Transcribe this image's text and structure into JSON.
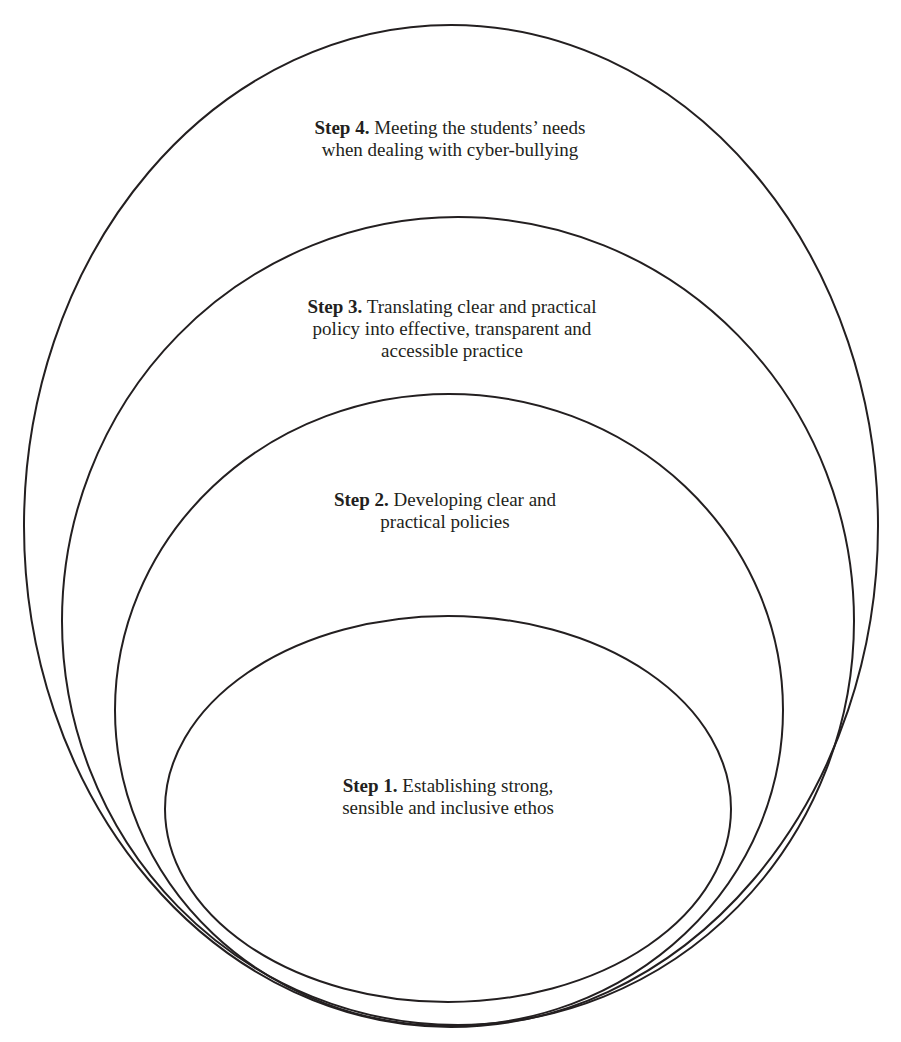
{
  "diagram": {
    "type": "nested-ellipses",
    "stroke_color": "#231f20",
    "background": "#ffffff",
    "layers": [
      {
        "id": "step4",
        "step_label": "Step 4.",
        "lines": [
          "Meeting the students’ needs",
          "when dealing with cyber-bullying"
        ],
        "line1_rest": " Meeting the students’ needs",
        "line2": "when dealing with cyber-bullying",
        "ellipse": {
          "cx": 451,
          "cy": 526,
          "rx": 427,
          "ry": 501
        }
      },
      {
        "id": "step3",
        "step_label": "Step 3.",
        "line1_rest": " Translating clear and practical",
        "line2": "policy into effective, transparent and",
        "line3": "accessible practice",
        "ellipse": {
          "cx": 458,
          "cy": 621,
          "rx": 396,
          "ry": 404
        }
      },
      {
        "id": "step2",
        "step_label": "Step 2.",
        "line1_rest": " Developing clear and",
        "line2": "practical policies",
        "ellipse": {
          "cx": 449,
          "cy": 710,
          "rx": 334,
          "ry": 316
        }
      },
      {
        "id": "step1",
        "step_label": "Step 1.",
        "line1_rest": " Establishing strong,",
        "line2": "sensible and inclusive ethos",
        "ellipse": {
          "cx": 448,
          "cy": 809,
          "rx": 283,
          "ry": 193
        }
      }
    ]
  }
}
